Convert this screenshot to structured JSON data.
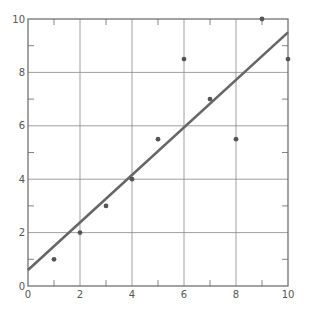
{
  "chart_data": {
    "type": "scatter",
    "title": "",
    "xlabel": "",
    "ylabel": "",
    "xlim": [
      0,
      10
    ],
    "ylim": [
      0,
      10
    ],
    "grid": true,
    "legend": null,
    "x_ticks": [
      0,
      2,
      4,
      6,
      8,
      10
    ],
    "y_ticks": [
      0,
      2,
      4,
      6,
      8,
      10
    ],
    "x_tick_labels": [
      "0",
      "2",
      "4",
      "6",
      "8",
      "10"
    ],
    "y_tick_labels": [
      "0",
      "2",
      "4",
      "6",
      "8",
      "10"
    ],
    "minor_ticks": [
      1,
      3,
      5,
      7,
      9
    ],
    "series": [
      {
        "name": "data points",
        "kind": "scatter",
        "x": [
          1,
          2,
          3,
          4,
          5,
          6,
          7,
          8,
          9,
          10
        ],
        "y": [
          1,
          2,
          3,
          4,
          5.5,
          8.5,
          7,
          5.5,
          10,
          8.5
        ],
        "color": "#555555"
      },
      {
        "name": "fitted line",
        "kind": "line",
        "x": [
          0,
          10
        ],
        "y": [
          0.6,
          9.5
        ],
        "color": "#666666"
      }
    ]
  },
  "colors": {
    "background": "#ffffff",
    "grid": "#888888",
    "axis": "#666666",
    "points": "#555555",
    "line": "#666666",
    "labels": "#555555"
  }
}
